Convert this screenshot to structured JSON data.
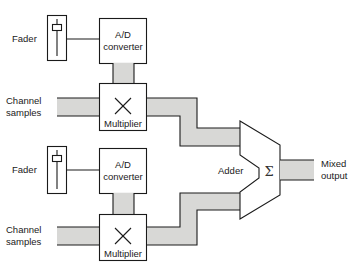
{
  "diagram": {
    "title": "",
    "colors": {
      "stroke": "#1a1a1a",
      "bus_fill": "#d8d8d6",
      "background": "#ffffff"
    },
    "channels": [
      {
        "fader_label": "Fader",
        "converter_label_line1": "A/D",
        "converter_label_line2": "converter",
        "input_label_line1": "Channel",
        "input_label_line2": "samples",
        "multiplier_label": "Multiplier",
        "multiplier_symbol": "×"
      },
      {
        "fader_label": "Fader",
        "converter_label_line1": "A/D",
        "converter_label_line2": "converter",
        "input_label_line1": "Channel",
        "input_label_line2": "samples",
        "multiplier_label": "Multiplier",
        "multiplier_symbol": "×"
      }
    ],
    "adder": {
      "label": "Adder",
      "symbol": "Σ"
    },
    "output": {
      "label_line1": "Mixed",
      "label_line2": "output"
    }
  }
}
